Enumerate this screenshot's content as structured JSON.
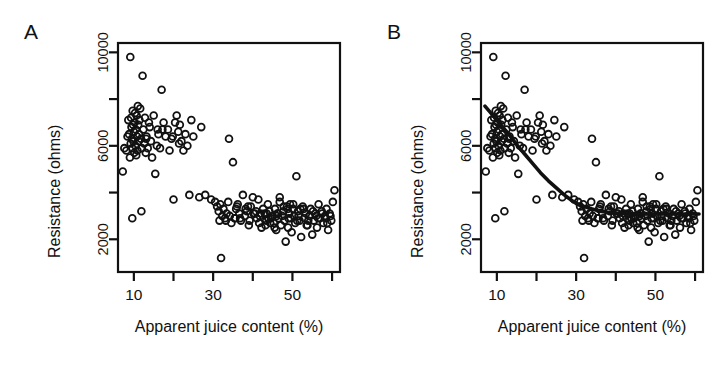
{
  "figure": {
    "background": "#ffffff",
    "stroke": "#111111",
    "panels": [
      {
        "id": "A",
        "label": "A",
        "has_fit_curve": false
      },
      {
        "id": "B",
        "label": "B",
        "has_fit_curve": true
      }
    ]
  },
  "chart_data": {
    "type": "scatter",
    "title": "",
    "xlabel": "Apparent juice content (%)",
    "ylabel": "Resistance (ohms)",
    "xlim": [
      6,
      62
    ],
    "ylim": [
      600,
      10400
    ],
    "grid": false,
    "legend": null,
    "marker": "open-circle",
    "xticks": [
      10,
      20,
      30,
      40,
      50,
      60
    ],
    "xtick_labels": [
      "10",
      "",
      "30",
      "",
      "50",
      ""
    ],
    "yticks": [
      2000,
      4000,
      6000,
      8000,
      10000
    ],
    "ytick_labels": [
      "2000",
      "",
      "6000",
      "",
      "10000"
    ],
    "panels": [
      {
        "panel": "A",
        "label": "A",
        "series": [
          {
            "name": "resistance-vs-juice",
            "x": [
              7.2,
              7.6,
              8.1,
              8.4,
              8.6,
              8.8,
              9.0,
              9.1,
              9.2,
              9.3,
              9.4,
              9.5,
              9.6,
              9.7,
              9.8,
              9.9,
              10.0,
              10.1,
              10.2,
              10.3,
              10.4,
              10.5,
              10.6,
              10.7,
              10.8,
              10.9,
              11.0,
              11.1,
              11.2,
              11.3,
              11.4,
              11.6,
              11.8,
              12.0,
              12.2,
              12.4,
              12.6,
              12.8,
              13.0,
              13.2,
              13.5,
              13.8,
              14.0,
              14.3,
              14.6,
              15.0,
              15.4,
              15.8,
              16.2,
              16.6,
              17.0,
              17.5,
              18.0,
              18.6,
              19.0,
              19.5,
              20.0,
              20.4,
              20.8,
              21.2,
              21.6,
              22.0,
              22.5,
              23.0,
              23.5,
              24.0,
              25.0,
              26.5,
              28.0,
              29.5,
              30.5,
              31.0,
              31.4,
              31.8,
              32.0,
              32.3,
              32.6,
              33.0,
              33.4,
              33.8,
              34.2,
              34.6,
              35.0,
              35.4,
              35.8,
              36.2,
              36.6,
              37.0,
              37.5,
              38.0,
              38.5,
              39.0,
              39.5,
              40.0,
              40.5,
              41.0,
              41.4,
              41.8,
              42.2,
              42.6,
              43.0,
              43.4,
              43.8,
              44.2,
              44.6,
              45.0,
              45.3,
              45.6,
              45.9,
              46.2,
              46.5,
              46.8,
              47.1,
              47.4,
              47.7,
              48.0,
              48.3,
              48.6,
              48.9,
              49.2,
              49.5,
              49.8,
              50.1,
              50.4,
              50.7,
              51.0,
              51.4,
              51.8,
              52.2,
              52.6,
              53.0,
              53.4,
              53.8,
              54.2,
              54.6,
              55.0,
              55.4,
              55.8,
              56.2,
              56.6,
              57.0,
              57.4,
              57.8,
              58.2,
              58.6,
              59.0,
              59.4,
              59.8,
              60.2,
              60.6,
              9.6,
              11.9,
              13.1,
              16.0,
              17.2,
              19.8,
              21.4,
              24.5,
              27.0,
              34.0,
              36.0,
              38.2,
              40.8,
              43.5,
              46.0,
              49.0,
              51.5,
              54.0,
              56.5,
              58.8,
              31.6,
              43.2,
              45.5,
              47.8,
              50.2,
              52.8,
              55.2,
              57.5,
              59.6,
              36.8,
              39.2,
              41.6,
              44.0,
              46.4,
              48.8,
              51.2,
              53.6,
              56.0,
              58.4,
              42.0,
              44.4,
              46.8,
              49.4,
              52.0,
              54.4,
              33.2,
              35.6,
              38.8,
              40.2,
              43.9
            ],
            "y": [
              4900,
              5900,
              5800,
              6400,
              7100,
              6500,
              5500,
              9800,
              6100,
              7200,
              6800,
              6300,
              5900,
              7500,
              6900,
              6200,
              6600,
              5700,
              7000,
              7400,
              6000,
              6700,
              5600,
              7300,
              6400,
              5800,
              7700,
              6900,
              6200,
              6500,
              7100,
              7600,
              6300,
              5900,
              9000,
              6700,
              6100,
              7200,
              5700,
              6400,
              5900,
              7000,
              6800,
              6200,
              5500,
              7300,
              4800,
              6000,
              6500,
              5900,
              8400,
              7000,
              6400,
              6700,
              5800,
              6300,
              3700,
              7000,
              7300,
              6600,
              6900,
              6200,
              5800,
              6500,
              6000,
              3900,
              6400,
              3800,
              3900,
              3700,
              3600,
              3400,
              3200,
              3500,
              1200,
              3000,
              3300,
              2900,
              3100,
              3600,
              3000,
              2700,
              5300,
              2900,
              3300,
              3500,
              3100,
              2800,
              3900,
              3000,
              3200,
              2600,
              3400,
              3800,
              3100,
              2900,
              3700,
              3000,
              2500,
              3300,
              3100,
              2800,
              3500,
              3200,
              2900,
              3000,
              2700,
              3300,
              2400,
              3100,
              2900,
              3600,
              2600,
              3000,
              3200,
              2800,
              1900,
              3400,
              2500,
              3100,
              2900,
              2300,
              3300,
              3000,
              2700,
              4700,
              3200,
              2800,
              2100,
              3400,
              2900,
              3100,
              2600,
              3000,
              3300,
              2200,
              2800,
              3100,
              2500,
              3500,
              2900,
              3200,
              2700,
              3000,
              3300,
              2400,
              3100,
              2800,
              3600,
              4100,
              2900,
              3200,
              6300,
              6700,
              6700,
              6400,
              6100,
              7100,
              6800,
              6300,
              3400,
              3300,
              3200,
              3100,
              3000,
              2900,
              3000,
              2800,
              2900,
              2700,
              2800,
              2600,
              2500,
              3400,
              3500,
              3300,
              3200,
              3100,
              3000,
              2900,
              2800,
              2700,
              2900,
              3100,
              3300,
              2800,
              2600,
              3000,
              2900,
              3100,
              2700,
              3800,
              3500,
              3300,
              3000,
              2800,
              2900,
              3400,
              3100,
              2900,
              3300,
              3000
            ]
          }
        ],
        "fit_curve": null
      },
      {
        "panel": "B",
        "label": "B",
        "series": [
          {
            "name": "resistance-vs-juice",
            "x": [
              7.2,
              7.6,
              8.1,
              8.4,
              8.6,
              8.8,
              9.0,
              9.1,
              9.2,
              9.3,
              9.4,
              9.5,
              9.6,
              9.7,
              9.8,
              9.9,
              10.0,
              10.1,
              10.2,
              10.3,
              10.4,
              10.5,
              10.6,
              10.7,
              10.8,
              10.9,
              11.0,
              11.1,
              11.2,
              11.3,
              11.4,
              11.6,
              11.8,
              12.0,
              12.2,
              12.4,
              12.6,
              12.8,
              13.0,
              13.2,
              13.5,
              13.8,
              14.0,
              14.3,
              14.6,
              15.0,
              15.4,
              15.8,
              16.2,
              16.6,
              17.0,
              17.5,
              18.0,
              18.6,
              19.0,
              19.5,
              20.0,
              20.4,
              20.8,
              21.2,
              21.6,
              22.0,
              22.5,
              23.0,
              23.5,
              24.0,
              25.0,
              26.5,
              28.0,
              29.5,
              30.5,
              31.0,
              31.4,
              31.8,
              32.0,
              32.3,
              32.6,
              33.0,
              33.4,
              33.8,
              34.2,
              34.6,
              35.0,
              35.4,
              35.8,
              36.2,
              36.6,
              37.0,
              37.5,
              38.0,
              38.5,
              39.0,
              39.5,
              40.0,
              40.5,
              41.0,
              41.4,
              41.8,
              42.2,
              42.6,
              43.0,
              43.4,
              43.8,
              44.2,
              44.6,
              45.0,
              45.3,
              45.6,
              45.9,
              46.2,
              46.5,
              46.8,
              47.1,
              47.4,
              47.7,
              48.0,
              48.3,
              48.6,
              48.9,
              49.2,
              49.5,
              49.8,
              50.1,
              50.4,
              50.7,
              51.0,
              51.4,
              51.8,
              52.2,
              52.6,
              53.0,
              53.4,
              53.8,
              54.2,
              54.6,
              55.0,
              55.4,
              55.8,
              56.2,
              56.6,
              57.0,
              57.4,
              57.8,
              58.2,
              58.6,
              59.0,
              59.4,
              59.8,
              60.2,
              60.6,
              9.6,
              11.9,
              13.1,
              16.0,
              17.2,
              19.8,
              21.4,
              24.5,
              27.0,
              34.0,
              36.0,
              38.2,
              40.8,
              43.5,
              46.0,
              49.0,
              51.5,
              54.0,
              56.5,
              58.8,
              31.6,
              43.2,
              45.5,
              47.8,
              50.2,
              52.8,
              55.2,
              57.5,
              59.6,
              36.8,
              39.2,
              41.6,
              44.0,
              46.4,
              48.8,
              51.2,
              53.6,
              56.0,
              58.4,
              42.0,
              44.4,
              46.8,
              49.4,
              52.0,
              54.4,
              33.2,
              35.6,
              38.8,
              40.2,
              43.9
            ],
            "y": [
              4900,
              5900,
              5800,
              6400,
              7100,
              6500,
              5500,
              9800,
              6100,
              7200,
              6800,
              6300,
              5900,
              7500,
              6900,
              6200,
              6600,
              5700,
              7000,
              7400,
              6000,
              6700,
              5600,
              7300,
              6400,
              5800,
              7700,
              6900,
              6200,
              6500,
              7100,
              7600,
              6300,
              5900,
              9000,
              6700,
              6100,
              7200,
              5700,
              6400,
              5900,
              7000,
              6800,
              6200,
              5500,
              7300,
              4800,
              6000,
              6500,
              5900,
              8400,
              7000,
              6400,
              6700,
              5800,
              6300,
              3700,
              7000,
              7300,
              6600,
              6900,
              6200,
              5800,
              6500,
              6000,
              3900,
              6400,
              3800,
              3900,
              3700,
              3600,
              3400,
              3200,
              3500,
              1200,
              3000,
              3300,
              2900,
              3100,
              3600,
              3000,
              2700,
              5300,
              2900,
              3300,
              3500,
              3100,
              2800,
              3900,
              3000,
              3200,
              2600,
              3400,
              3800,
              3100,
              2900,
              3700,
              3000,
              2500,
              3300,
              3100,
              2800,
              3500,
              3200,
              2900,
              3000,
              2700,
              3300,
              2400,
              3100,
              2900,
              3600,
              2600,
              3000,
              3200,
              2800,
              1900,
              3400,
              2500,
              3100,
              2900,
              2300,
              3300,
              3000,
              2700,
              4700,
              3200,
              2800,
              2100,
              3400,
              2900,
              3100,
              2600,
              3000,
              3300,
              2200,
              2800,
              3100,
              2500,
              3500,
              2900,
              3200,
              2700,
              3000,
              3300,
              2400,
              3100,
              2800,
              3600,
              4100,
              2900,
              3200,
              6300,
              6700,
              6700,
              6400,
              6100,
              7100,
              6800,
              6300,
              3400,
              3300,
              3200,
              3100,
              3000,
              2900,
              3000,
              2800,
              2900,
              2700,
              2800,
              2600,
              2500,
              3400,
              3500,
              3300,
              3200,
              3100,
              3000,
              2900,
              2800,
              2700,
              2900,
              3100,
              3300,
              2800,
              2600,
              3000,
              2900,
              3100,
              2700,
              3800,
              3500,
              3300,
              3000,
              2800,
              2900,
              3400,
              3100,
              2900,
              3300,
              3000
            ]
          }
        ],
        "fit_curve": {
          "name": "smoothed-fit",
          "x": [
            7.0,
            9.0,
            11.0,
            13.0,
            15.0,
            17.0,
            19.0,
            21.0,
            23.0,
            25.0,
            27.0,
            29.0,
            31.0,
            32.0,
            33.0,
            34.0,
            35.0,
            36.0,
            38.0,
            40.0,
            42.0,
            44.0,
            46.0,
            48.0,
            50.0,
            52.0,
            54.0,
            56.0,
            58.0,
            60.0,
            61.0
          ],
          "y": [
            7700,
            7300,
            6900,
            6500,
            6050,
            5650,
            5250,
            4850,
            4500,
            4200,
            3900,
            3650,
            3450,
            3400,
            3350,
            3300,
            3250,
            3200,
            3150,
            3120,
            3100,
            3090,
            3080,
            3080,
            3080,
            3080,
            3080,
            3080,
            3080,
            3080,
            3080
          ]
        }
      }
    ]
  }
}
